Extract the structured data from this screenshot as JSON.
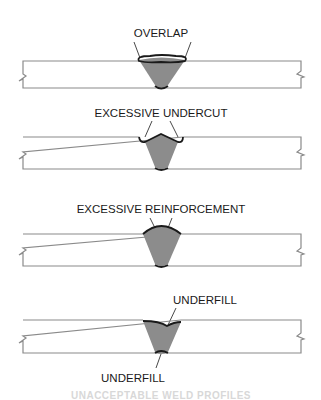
{
  "diagram": {
    "panels": [
      {
        "id": "overlap",
        "label": "OVERLAP"
      },
      {
        "id": "excessive-undercut",
        "label": "EXCESSIVE UNDERCUT"
      },
      {
        "id": "excessive-reinforcement",
        "label": "EXCESSIVE REINFORCEMENT"
      },
      {
        "id": "underfill",
        "label": "UNDERFILL",
        "label_bottom": "UNDERFILL"
      }
    ],
    "caption": "UNACCEPTABLE WELD PROFILES",
    "colors": {
      "plate_outline": "#8a8a8a",
      "weld_fill": "#8c8c8c",
      "weld_face": "#1a1a1a",
      "background": "#ffffff"
    }
  }
}
